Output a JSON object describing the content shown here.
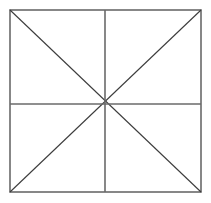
{
  "canvas": {
    "width": 211,
    "height": 203,
    "background_color": "#ffffff"
  },
  "figure": {
    "name": "square-with-cross-and-diagonals",
    "square": {
      "left": 10,
      "top": 10,
      "right": 201,
      "bottom": 192,
      "width": 191,
      "height": 182,
      "stroke_color": "#6a6a6a",
      "stroke_width": 1.6,
      "fill_color": "#ffffff"
    },
    "center_point": {
      "x": 105,
      "y": 104
    },
    "midlines": {
      "stroke_color": "#6a6a6a",
      "stroke_width": 1.6,
      "segments": [
        {
          "label": "vertical-midline",
          "x1": 105,
          "y1": 10,
          "x2": 105,
          "y2": 192
        },
        {
          "label": "horizontal-midline",
          "x1": 10,
          "y1": 104,
          "x2": 201,
          "y2": 104
        }
      ]
    },
    "diagonals": {
      "stroke_color": "#3c3c3c",
      "stroke_width": 1.1,
      "segments": [
        {
          "label": "diagonal-tl-br",
          "x1": 10,
          "y1": 10,
          "x2": 201,
          "y2": 192
        },
        {
          "label": "diagonal-tr-bl",
          "x1": 201,
          "y1": 10,
          "x2": 10,
          "y2": 192
        }
      ]
    },
    "sector_count": 8,
    "radiating_line_count": 8
  }
}
